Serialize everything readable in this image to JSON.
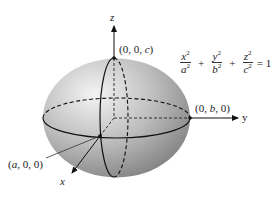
{
  "figure": {
    "equation": {
      "terms": [
        {
          "numerator": "x",
          "denominator": "a",
          "power": "2"
        },
        {
          "numerator": "y",
          "denominator": "b",
          "power": "2"
        },
        {
          "numerator": "z",
          "denominator": "c",
          "power": "2"
        }
      ],
      "plus": "+",
      "rhs": "= 1"
    },
    "axes": {
      "x_label": "x",
      "y_label": "y",
      "z_label": "z"
    },
    "points": {
      "z_intercept": {
        "pre": "(0, 0, ",
        "var": "c",
        "post": ")"
      },
      "y_intercept": {
        "pre": "(0, ",
        "var": "b",
        "post": ", 0)"
      },
      "x_intercept": {
        "pre": "(",
        "var": "a",
        "post": ", 0, 0)"
      }
    },
    "colors": {
      "surface_light": "#f2f2f2",
      "surface_dark": "#8a8a8a",
      "line": "#111111",
      "background": "#ffffff"
    }
  }
}
